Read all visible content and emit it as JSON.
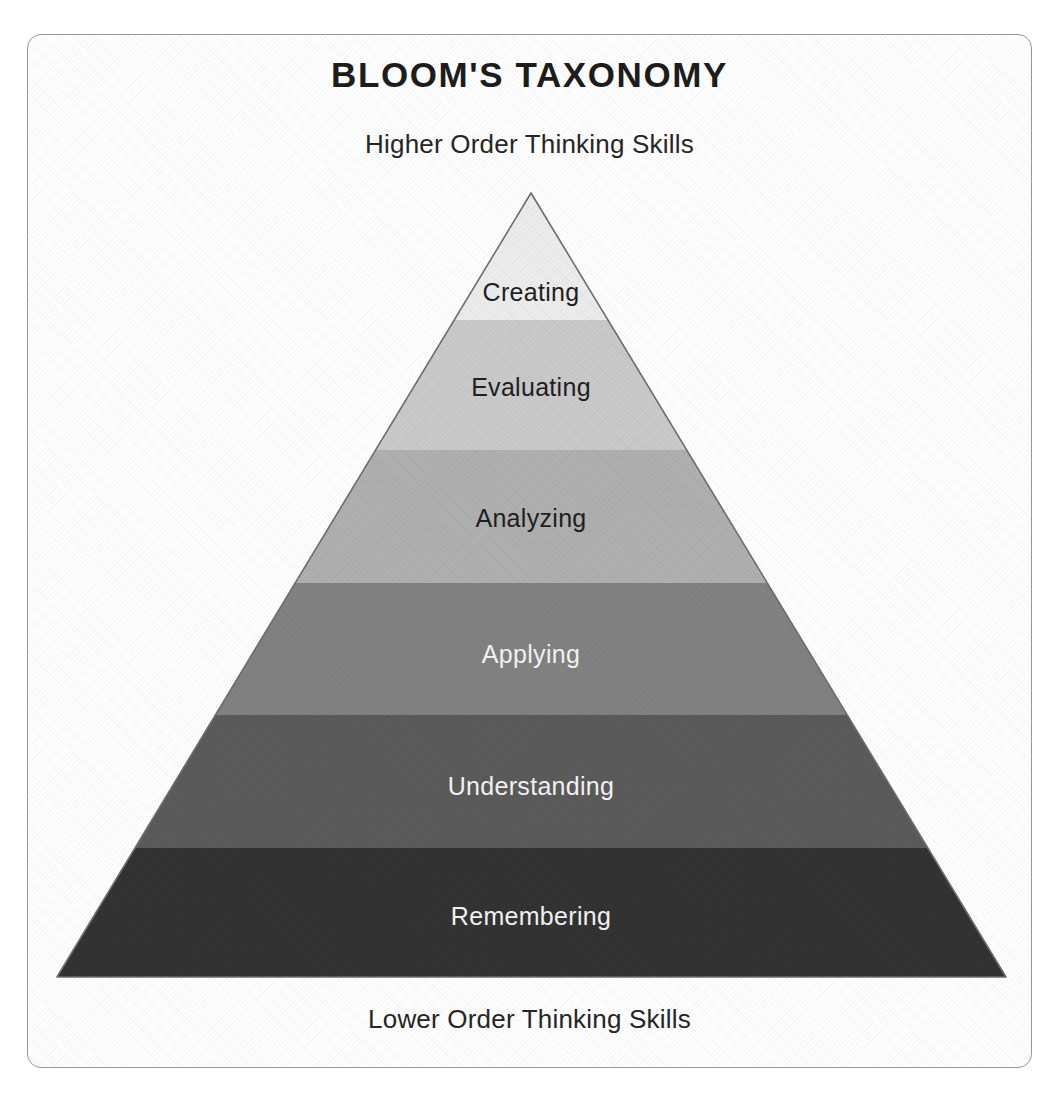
{
  "poster": {
    "title": "BLOOM'S TAXONOMY",
    "top_caption": "Higher Order Thinking Skills",
    "bottom_caption": "Lower Order Thinking Skills",
    "background_color": "#ffffff",
    "frame_border_color": "#9a9a9a",
    "title_color": "#1d1d1d"
  },
  "chart_data": {
    "type": "pyramid",
    "title": "BLOOM'S TAXONOMY",
    "subtitle_top": "Higher Order Thinking Skills",
    "subtitle_bottom": "Lower Order Thinking Skills",
    "orientation": "apex-up",
    "level_count": 6,
    "apex": {
      "x": 531,
      "y": 193
    },
    "base_left": {
      "x": 57,
      "y": 977
    },
    "base_right": {
      "x": 1006,
      "y": 977
    },
    "outline_color": "#6e6e6e",
    "levels": [
      {
        "rank": 6,
        "label": "Creating",
        "fill": "#ededed",
        "text_color": "#1f1f1f",
        "y_top": 193,
        "y_bottom": 320,
        "label_x": 531,
        "label_y": 292
      },
      {
        "rank": 5,
        "label": "Evaluating",
        "fill": "#cacaca",
        "text_color": "#1f1f1f",
        "y_top": 320,
        "y_bottom": 450,
        "label_x": 531,
        "label_y": 387
      },
      {
        "rank": 4,
        "label": "Analyzing",
        "fill": "#b0b0b0",
        "text_color": "#1f1f1f",
        "y_top": 450,
        "y_bottom": 583,
        "label_x": 531,
        "label_y": 518
      },
      {
        "rank": 3,
        "label": "Applying",
        "fill": "#828282",
        "text_color": "#f4f4f4",
        "y_top": 583,
        "y_bottom": 715,
        "label_x": 531,
        "label_y": 654
      },
      {
        "rank": 2,
        "label": "Understanding",
        "fill": "#5b5b5b",
        "text_color": "#f4f4f4",
        "y_top": 715,
        "y_bottom": 848,
        "label_x": 531,
        "label_y": 786
      },
      {
        "rank": 1,
        "label": "Remembering",
        "fill": "#333333",
        "text_color": "#f4f4f4",
        "y_top": 848,
        "y_bottom": 977,
        "label_x": 531,
        "label_y": 916
      }
    ]
  }
}
